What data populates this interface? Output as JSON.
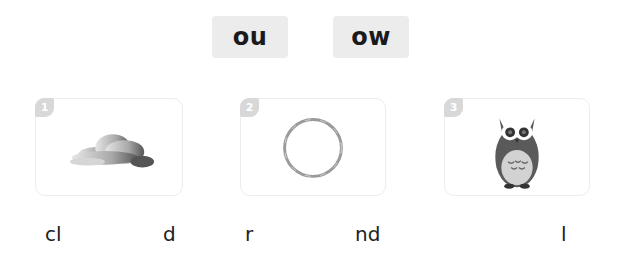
{
  "tiles": [
    {
      "label": "ou"
    },
    {
      "label": "ow"
    }
  ],
  "cards": [
    {
      "number": "1",
      "picture": "cloud",
      "word_start": "cl",
      "word_end": "d"
    },
    {
      "number": "2",
      "picture": "round",
      "word_start": "r",
      "word_end": "nd"
    },
    {
      "number": "3",
      "picture": "owl",
      "word_start": "",
      "word_end": "l"
    }
  ],
  "colors": {
    "tile_bg": "#ececec",
    "badge_bg": "#d8d8d8",
    "card_border": "#ececec",
    "text": "#222222"
  }
}
